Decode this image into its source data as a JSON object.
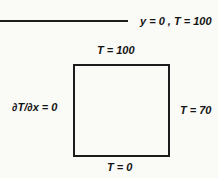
{
  "diagram": {
    "top_line_label": "y = 0 , T = 100",
    "square": {
      "top_label": "T = 100",
      "left_label": "∂T/∂x = 0",
      "right_label": "T = 70",
      "bottom_label": "T = 0"
    }
  }
}
